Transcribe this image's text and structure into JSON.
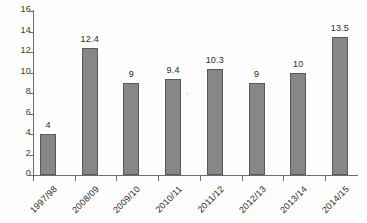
{
  "chart_data": {
    "type": "bar",
    "title": "",
    "xlabel": "",
    "ylabel": "",
    "categories": [
      "1997/98",
      "2008/09",
      "2009/10",
      "2010/11",
      "2011/12",
      "2012/13",
      "2013/14",
      "2014/15"
    ],
    "values": [
      4,
      12.4,
      9,
      9.4,
      10.3,
      9,
      10,
      13.5
    ],
    "value_labels": [
      "4",
      "12.4",
      "9",
      "9.4",
      "10.3",
      "9",
      "10",
      "13.5"
    ],
    "ylim": [
      0,
      16
    ],
    "ytick_step": 2,
    "yticks": [
      "16",
      "14",
      "12",
      "10",
      "8",
      "6",
      "4",
      "2",
      "0"
    ],
    "grid": false,
    "legend": false,
    "legend_position": "none",
    "bar_color": "#878787",
    "bar_border_color": "#585858",
    "axis_color": "#6e6e6e",
    "text_color": "#2b2b2b",
    "background_color": "#fdfdfd",
    "xtick_label_rotation_deg": -45
  }
}
